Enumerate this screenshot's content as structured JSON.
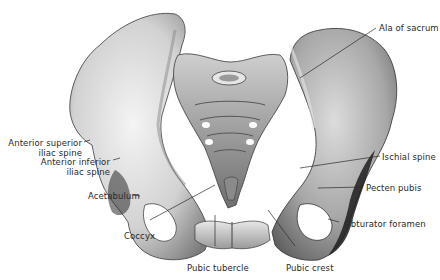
{
  "figure": {
    "labels": {
      "ala_of_sacrum": "Ala of sacrum",
      "asis_line1": "Anterior superior",
      "asis_line2": "iliac spine",
      "aiis_line1": "Anterior inferior",
      "aiis_line2": "iliac spine",
      "acetabulum": "Acetabulum",
      "coccyx": "Coccyx",
      "pubic_tubercle": "Pubic tubercle",
      "pubic_crest": "Pubic crest",
      "ischial_spine": "Ischial spine",
      "pecten_pubis": "Pecten pubis",
      "obturator_foramen": "Obturator foramen"
    },
    "colors": {
      "bone_light": "#f2f2f2",
      "bone_mid": "#bdbdbd",
      "bone_dark": "#5a5a5a",
      "shadow": "#1e1e1e",
      "label_text": "#2a2a2a",
      "leader_line": "#2a2a2a"
    }
  }
}
